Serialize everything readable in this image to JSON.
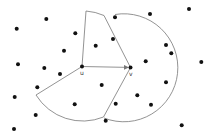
{
  "diagram": {
    "type": "geometric-sector-diagram",
    "labels": {
      "u": "u",
      "v": "v"
    },
    "colors": {
      "stroke": "#777777",
      "dot": "#111111",
      "background": "#ffffff"
    },
    "nodes": {
      "u": {
        "x": 82,
        "y": 66.5
      },
      "v": {
        "x": 130.5,
        "y": 67.5
      }
    },
    "points": [
      [
        189,
        9
      ],
      [
        150,
        14
      ],
      [
        115,
        17.3
      ],
      [
        46.3,
        19
      ],
      [
        16.7,
        28.7
      ],
      [
        75.3,
        33.3
      ],
      [
        113,
        39
      ],
      [
        95.7,
        45.7
      ],
      [
        166,
        45
      ],
      [
        171.3,
        53.3
      ],
      [
        64,
        50.7
      ],
      [
        145.7,
        61.3
      ],
      [
        201.3,
        62
      ],
      [
        18,
        64.3
      ],
      [
        44.3,
        68
      ],
      [
        60,
        74
      ],
      [
        166,
        82.3
      ],
      [
        101.7,
        85
      ],
      [
        37.3,
        87.3
      ],
      [
        14.7,
        97
      ],
      [
        137.3,
        95.3
      ],
      [
        115.7,
        103.7
      ],
      [
        151,
        104.7
      ],
      [
        74.7,
        104.3
      ],
      [
        35.7,
        115
      ],
      [
        105.7,
        120.7
      ],
      [
        181.7,
        125.3
      ],
      [
        14,
        129
      ]
    ]
  }
}
